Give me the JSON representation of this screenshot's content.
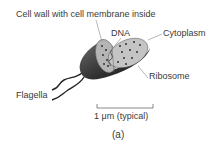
{
  "diagram": {
    "labels": {
      "cell_wall": "Cell wall with cell membrane inside",
      "dna": "DNA",
      "cytoplasm": "Cytoplasm",
      "ribosome": "Ribosome",
      "flagella": "Flagella",
      "scale": "1 μm (typical)",
      "caption": "(a)"
    },
    "colors": {
      "body_dark": "#3a3a3a",
      "body_mid": "#8a8a8a",
      "cut_face": "#bdbdbd",
      "dots": "#222222",
      "leader_lines": "#888888"
    }
  }
}
